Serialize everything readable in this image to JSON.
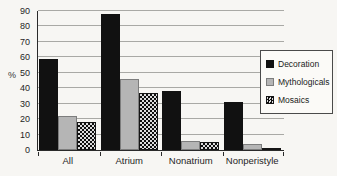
{
  "chart_data": {
    "type": "bar",
    "title": "",
    "categories": [
      "All",
      "Atrium",
      "Nonatrium",
      "Nonperistyle"
    ],
    "series": [
      {
        "name": "Decoration",
        "color": "#111111",
        "pattern": "solid",
        "bordered": false,
        "values": [
          59,
          88,
          38,
          31
        ]
      },
      {
        "name": "Mythologicals",
        "color": "#b5b5b5",
        "pattern": "solid",
        "bordered": true,
        "values": [
          22,
          46,
          6,
          4
        ]
      },
      {
        "name": "Mosaics",
        "color": "#111111",
        "pattern": "checker",
        "bordered": false,
        "values": [
          18,
          37,
          5,
          1
        ]
      }
    ],
    "xlabel": "",
    "ylabel": "%",
    "ylim": [
      0,
      90
    ],
    "yticks": [
      0,
      10,
      20,
      30,
      40,
      50,
      60,
      70,
      80,
      90
    ],
    "grid": true,
    "legend_position": "right",
    "colors": {
      "background": "#f7f6f3",
      "gridline": "#a9a9a5",
      "axis": "#2a2a2a",
      "decoration": "#111111",
      "mythologicals": "#b5b5b5"
    }
  }
}
